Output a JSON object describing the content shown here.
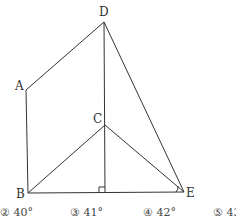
{
  "diagram": {
    "points": {
      "A": {
        "label": "A",
        "x": 26,
        "y": 90
      },
      "B": {
        "label": "B",
        "x": 28,
        "y": 193
      },
      "C": {
        "label": "C",
        "x": 105,
        "y": 125
      },
      "D": {
        "label": "D",
        "x": 104,
        "y": 22
      },
      "E": {
        "label": "E",
        "x": 184,
        "y": 192
      }
    },
    "segments": [
      "AD",
      "AB",
      "DE",
      "DC",
      "CB",
      "CE",
      "BE",
      "C-foot"
    ],
    "right_angle_marker": "foot of perpendicular from C on BE",
    "angle_marker": "angle at E",
    "line_color": "#333333"
  },
  "choices": [
    {
      "label": "② 40°"
    },
    {
      "label": "③ 41°"
    },
    {
      "label": "④ 42°"
    },
    {
      "label": "⑤ 43°"
    }
  ]
}
